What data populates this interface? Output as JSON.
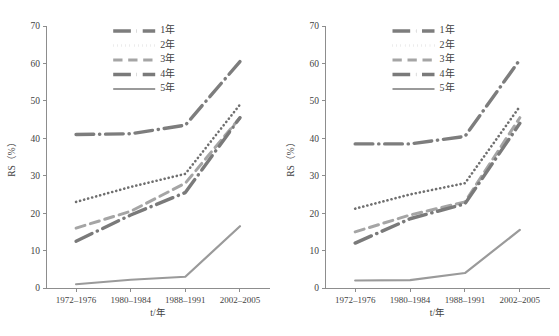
{
  "figure": {
    "panel_count": 2,
    "background": "#ffffff",
    "line_color": "#7d7d7d",
    "axis_color": "#8d8d8d",
    "text_color": "#3f3f3f"
  },
  "chart_data": [
    {
      "type": "line",
      "panel": "left",
      "title": "",
      "xlabel": "t/年",
      "ylabel": "RS（%）",
      "categories": [
        "1972–1976",
        "1980–1984",
        "1988–1991",
        "2002–2005"
      ],
      "x": [
        1,
        2,
        3,
        4
      ],
      "ylim": [
        0,
        70
      ],
      "yticks": [
        0,
        10,
        20,
        30,
        40,
        50,
        60,
        70
      ],
      "grid": false,
      "legend_position": "top-center",
      "series": [
        {
          "name": "1年",
          "style": "dashdot",
          "width": 3.4,
          "color": "#7d7d7d",
          "values": [
            41.0,
            41.2,
            43.5,
            60.5
          ]
        },
        {
          "name": "2年",
          "style": "dotted",
          "width": 2.6,
          "color": "#6f6f6f",
          "values": [
            23.0,
            27.0,
            30.5,
            49.0
          ]
        },
        {
          "name": "3年",
          "style": "dashed",
          "width": 3.0,
          "color": "#a5a5a5",
          "values": [
            16.0,
            20.5,
            28.0,
            45.5
          ]
        },
        {
          "name": "4年",
          "style": "dashdot-thick",
          "width": 3.4,
          "color": "#7a7a7a",
          "values": [
            12.5,
            19.5,
            25.5,
            45.5
          ]
        },
        {
          "name": "5年",
          "style": "solid",
          "width": 2.2,
          "color": "#9a9a9a",
          "values": [
            1.0,
            2.2,
            3.0,
            16.5
          ]
        }
      ]
    },
    {
      "type": "line",
      "panel": "right",
      "title": "",
      "xlabel": "t/年",
      "ylabel": "RS（%）",
      "categories": [
        "1972–1976",
        "1980–1984",
        "1988–1991",
        "2002–2005"
      ],
      "x": [
        1,
        2,
        3,
        4
      ],
      "ylim": [
        0,
        70
      ],
      "yticks": [
        0,
        10,
        20,
        30,
        40,
        50,
        60,
        70
      ],
      "grid": false,
      "legend_position": "top-center",
      "series": [
        {
          "name": "1年",
          "style": "dashdot",
          "width": 3.4,
          "color": "#7d7d7d",
          "values": [
            38.5,
            38.5,
            40.5,
            61.0
          ]
        },
        {
          "name": "2年",
          "style": "dotted",
          "width": 2.6,
          "color": "#6f6f6f",
          "values": [
            21.2,
            25.0,
            28.0,
            48.5
          ]
        },
        {
          "name": "3年",
          "style": "dashed",
          "width": 3.0,
          "color": "#a5a5a5",
          "values": [
            15.0,
            19.5,
            23.0,
            45.5
          ]
        },
        {
          "name": "4年",
          "style": "dashdot-thick",
          "width": 3.4,
          "color": "#7a7a7a",
          "values": [
            12.0,
            18.5,
            22.5,
            44.0
          ]
        },
        {
          "name": "5年",
          "style": "solid",
          "width": 2.2,
          "color": "#9a9a9a",
          "values": [
            2.0,
            2.1,
            4.0,
            15.5
          ]
        }
      ]
    }
  ],
  "legend": {
    "entries": [
      {
        "label": "1年",
        "style": "dashdot"
      },
      {
        "label": "2年",
        "style": "dotted"
      },
      {
        "label": "3年",
        "style": "dashed"
      },
      {
        "label": "4年",
        "style": "dashdot-thick"
      },
      {
        "label": "5年",
        "style": "solid"
      }
    ]
  },
  "axes": {
    "y_ticks": [
      "0",
      "10",
      "20",
      "30",
      "40",
      "50",
      "60",
      "70"
    ],
    "x_ticks": [
      "1972–1976",
      "1980–1984",
      "1988–1991",
      "2002–2005"
    ],
    "y_title": "RS（%）",
    "x_title": "t/年"
  }
}
